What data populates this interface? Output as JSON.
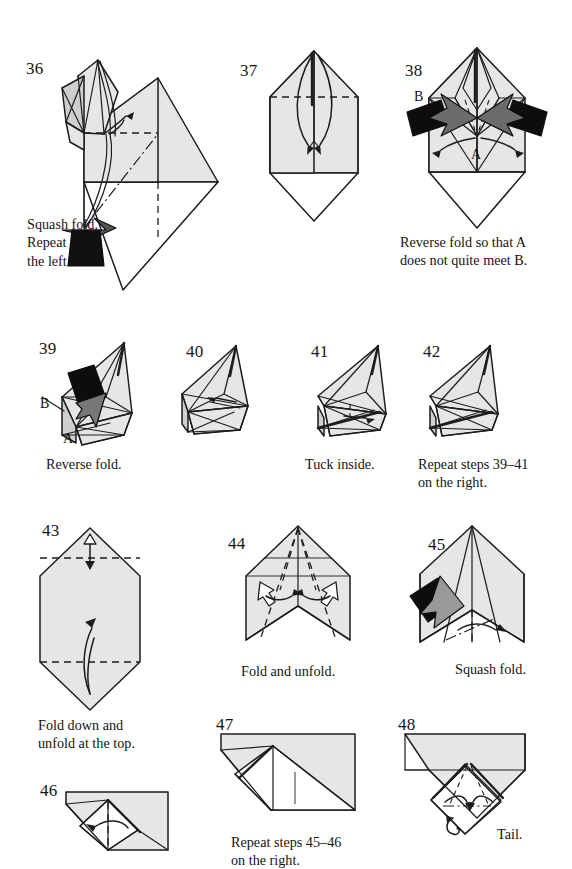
{
  "page": {
    "width": 572,
    "height": 869,
    "background_color": "#ffffff",
    "paper_front_color": "#e6e6e6",
    "paper_back_color": "#ffffff",
    "paper_shadow_color": "#cfcfcf",
    "line_color": "#1d1d1d"
  },
  "steps": [
    {
      "number": "36",
      "caption": "Squash fold.\nRepeat on\nthe left.",
      "labels": [],
      "symbols": [
        "valley-fold-dashed-line",
        "mountain-fold-dash-dot-line",
        "push-in-arrow-black",
        "curved-fold-arrow"
      ]
    },
    {
      "number": "37",
      "caption": "",
      "labels": [],
      "symbols": [
        "valley-fold-dashed-line",
        "two-curved-fold-arrows"
      ]
    },
    {
      "number": "38",
      "caption": "Reverse fold so that A\ndoes not quite meet B.",
      "labels": [
        "B",
        "A"
      ],
      "symbols": [
        "reverse-fold-black-arrow-left",
        "reverse-fold-black-arrow-right",
        "curved-arrow-left",
        "curved-arrow-right",
        "valley-fold-dashed-line"
      ]
    },
    {
      "number": "39",
      "caption": "Reverse fold.",
      "labels": [
        "B",
        "A"
      ],
      "symbols": [
        "reverse-fold-black-arrow",
        "pointer-line"
      ]
    },
    {
      "number": "40",
      "caption": "",
      "labels": [],
      "symbols": [
        "small-arrow"
      ]
    },
    {
      "number": "41",
      "caption": "Tuck inside.",
      "labels": [],
      "symbols": [
        "tuck-arrow"
      ]
    },
    {
      "number": "42",
      "caption": "Repeat steps 39–41\non the right.",
      "labels": [],
      "symbols": []
    },
    {
      "number": "43",
      "caption": "Fold down and\nunfold at the top.",
      "labels": [],
      "symbols": [
        "valley-fold-dashed-line-top",
        "valley-fold-dashed-line-bottom",
        "fold-and-unfold-arrow-top",
        "fold-up-arrow"
      ]
    },
    {
      "number": "44",
      "caption": "Fold and unfold.",
      "labels": [],
      "symbols": [
        "valley-fold-dashed-lines",
        "fold-and-unfold-arrow-left",
        "fold-and-unfold-arrow-right"
      ]
    },
    {
      "number": "45",
      "caption": "Squash fold.",
      "labels": [],
      "symbols": [
        "squash-fold-black-arrow",
        "mountain-fold-dash-dot-line",
        "spread-arrows"
      ]
    },
    {
      "number": "46",
      "caption": "",
      "labels": [],
      "symbols": [
        "valley-fold-dashed-line",
        "fold-left-arrow"
      ]
    },
    {
      "number": "47",
      "caption": "Repeat steps 45–46\non the right.",
      "labels": [],
      "symbols": []
    },
    {
      "number": "48",
      "caption": "Tail.",
      "labels": [],
      "symbols": [
        "valley-fold-dashed-lines",
        "mountain-fold-dash-dot-line",
        "two-inward-arrows",
        "small-loop-arrow"
      ]
    }
  ]
}
